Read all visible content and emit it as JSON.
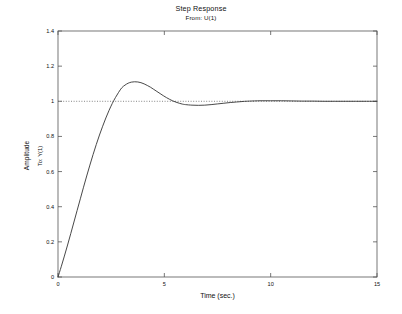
{
  "figure": {
    "background_color": "#ffffff",
    "axes_color": "#555555",
    "curve_color": "#333333",
    "reference_color": "#666666"
  },
  "chart_data": {
    "type": "line",
    "title": "Step Response",
    "subtitle": "From: U(1)",
    "xlabel": "Time (sec.)",
    "ylabel": "Amplitude",
    "ylabel_inner": "To: Y(1)",
    "xlim": [
      0,
      15
    ],
    "ylim": [
      0,
      1.4
    ],
    "xticks": [
      0,
      5,
      10,
      15
    ],
    "xtick_labels": [
      "0",
      "5",
      "10",
      "15"
    ],
    "yticks": [
      0,
      0.2,
      0.4,
      0.6,
      0.8,
      1,
      1.2,
      1.4
    ],
    "ytick_labels": [
      "0",
      "0.2",
      "0.4",
      "0.6",
      "0.8",
      "1",
      "1.2",
      "1.4"
    ],
    "grid": false,
    "legend": null,
    "reference_line": {
      "label": "steady-state",
      "y": 1,
      "style": "dotted"
    },
    "annotations": {
      "peak_time": 3.0,
      "peak_amplitude": 1.11,
      "final_value": 1.0,
      "undershoot_time": 6.3,
      "undershoot_amplitude": 0.978,
      "settling_time": 9.0
    },
    "series": [
      {
        "name": "Step response",
        "x": [
          0,
          0.15,
          0.3,
          0.45,
          0.6,
          0.75,
          0.9,
          1.05,
          1.2,
          1.35,
          1.5,
          1.65,
          1.8,
          1.95,
          2.1,
          2.25,
          2.4,
          2.55,
          2.7,
          2.85,
          3.0,
          3.15,
          3.3,
          3.45,
          3.6,
          3.75,
          3.9,
          4.05,
          4.2,
          4.35,
          4.5,
          4.65,
          4.8,
          4.95,
          5.1,
          5.25,
          5.4,
          5.55,
          5.7,
          5.85,
          6.0,
          6.3,
          6.6,
          6.9,
          7.2,
          7.5,
          7.8,
          8.1,
          8.4,
          8.7,
          9.0,
          9.5,
          10.0,
          10.5,
          11.0,
          11.5,
          12.0,
          12.5,
          13.0,
          13.5,
          14.0,
          14.5,
          15.0
        ],
        "y": [
          0.0,
          0.058,
          0.119,
          0.182,
          0.247,
          0.313,
          0.379,
          0.445,
          0.511,
          0.575,
          0.637,
          0.697,
          0.754,
          0.808,
          0.858,
          0.905,
          0.948,
          0.987,
          1.021,
          1.051,
          1.077,
          1.092,
          1.103,
          1.109,
          1.111,
          1.11,
          1.106,
          1.099,
          1.09,
          1.08,
          1.068,
          1.056,
          1.044,
          1.032,
          1.021,
          1.011,
          1.002,
          0.995,
          0.989,
          0.984,
          0.981,
          0.978,
          0.977,
          0.978,
          0.981,
          0.985,
          0.989,
          0.993,
          0.996,
          0.999,
          1.001,
          1.003,
          1.003,
          1.003,
          1.002,
          1.001,
          1.001,
          1.0,
          1.0,
          1.0,
          1.0,
          1.0,
          1.0
        ]
      }
    ]
  }
}
